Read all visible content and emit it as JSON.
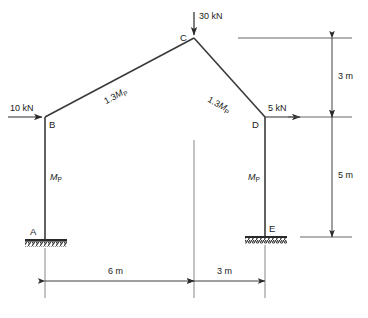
{
  "figure": {
    "type": "structural-frame-diagram",
    "line_color": "#3a3a3a",
    "text_color": "#1a1a1a"
  },
  "nodes": [
    {
      "id": "A",
      "label": "A",
      "x": 45,
      "y": 240,
      "support": "fixed"
    },
    {
      "id": "B",
      "label": "B",
      "x": 45,
      "y": 117,
      "support": "none"
    },
    {
      "id": "C",
      "label": "C",
      "x": 194,
      "y": 38,
      "support": "none"
    },
    {
      "id": "D",
      "label": "D",
      "x": 265,
      "y": 117,
      "support": "none"
    },
    {
      "id": "E",
      "label": "E",
      "x": 265,
      "y": 237,
      "support": "fixed"
    }
  ],
  "members": [
    {
      "id": "AB",
      "from": "A",
      "to": "B",
      "capacity_label": "Mp",
      "capacity_main": "M",
      "capacity_sub": "P",
      "capacity_prefix": ""
    },
    {
      "id": "BC",
      "from": "B",
      "to": "C",
      "capacity_label": "1.3Mp",
      "capacity_main": "M",
      "capacity_sub": "P",
      "capacity_prefix": "1.3"
    },
    {
      "id": "CD",
      "from": "C",
      "to": "D",
      "capacity_label": "1.3Mp",
      "capacity_main": "M",
      "capacity_sub": "P",
      "capacity_prefix": "1.3"
    },
    {
      "id": "DE",
      "from": "D",
      "to": "E",
      "capacity_label": "Mp",
      "capacity_main": "M",
      "capacity_sub": "P",
      "capacity_prefix": ""
    }
  ],
  "loads": [
    {
      "id": "load-B",
      "label": "10 kN",
      "magnitude": 10,
      "unit": "kN",
      "direction": "horizontal-right",
      "at_node": "B"
    },
    {
      "id": "load-C",
      "label": "30 kN",
      "magnitude": 30,
      "unit": "kN",
      "direction": "vertical-down",
      "at_node": "C"
    },
    {
      "id": "load-D",
      "label": "5 kN",
      "magnitude": 5,
      "unit": "kN",
      "direction": "horizontal-right",
      "at_node": "D"
    }
  ],
  "dimensions": [
    {
      "id": "dim-span-left",
      "label": "6 m",
      "value": 6,
      "unit": "m",
      "orientation": "horizontal"
    },
    {
      "id": "dim-span-right",
      "label": "3 m",
      "value": 3,
      "unit": "m",
      "orientation": "horizontal"
    },
    {
      "id": "dim-apex-rise",
      "label": "3 m",
      "value": 3,
      "unit": "m",
      "orientation": "vertical"
    },
    {
      "id": "dim-column-height",
      "label": "5 m",
      "value": 5,
      "unit": "m",
      "orientation": "vertical"
    }
  ]
}
